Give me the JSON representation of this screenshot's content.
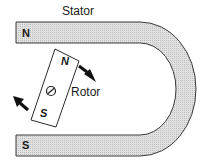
{
  "diagram": {
    "title": "Stator",
    "stator": {
      "top_pole": "N",
      "bottom_pole": "S"
    },
    "rotor": {
      "label": "Rotor",
      "north_pole": "N",
      "south_pole": "S",
      "pivot_icon": "pivot-icon"
    },
    "arrows": [
      {
        "name": "rotation-arrow-right",
        "direction": "down-right"
      },
      {
        "name": "rotation-arrow-left",
        "direction": "up-left"
      }
    ],
    "colors": {
      "stator_fill": "#d6d6d6",
      "outline": "#3a3a3a",
      "arrow": "#111111"
    }
  }
}
